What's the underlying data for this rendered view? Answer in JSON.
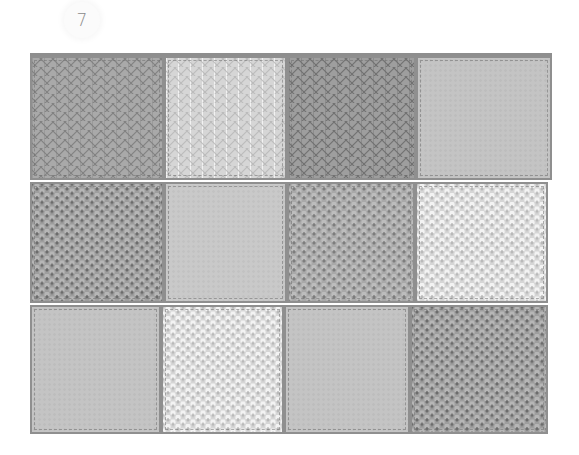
{
  "page": {
    "number": "7"
  },
  "blanket": {
    "rows": 3,
    "columns": 4,
    "squares": [
      {
        "row": 1,
        "col": 1,
        "stitch": "stockinette",
        "tone": "mid",
        "color": "#a9a9a9"
      },
      {
        "row": 1,
        "col": 2,
        "stitch": "stockinette",
        "tone": "light",
        "color": "#d6d6d6"
      },
      {
        "row": 1,
        "col": 3,
        "stitch": "stockinette",
        "tone": "dark",
        "color": "#9e9e9e"
      },
      {
        "row": 1,
        "col": 4,
        "stitch": "smooth",
        "tone": "flat",
        "color": "#c4c4c4"
      },
      {
        "row": 2,
        "col": 1,
        "stitch": "purl",
        "tone": "dark",
        "color": "#9e9e9e"
      },
      {
        "row": 2,
        "col": 2,
        "stitch": "smooth",
        "tone": "flat",
        "color": "#c9c9c9"
      },
      {
        "row": 2,
        "col": 3,
        "stitch": "purl",
        "tone": "mid",
        "color": "#a9a9a9"
      },
      {
        "row": 2,
        "col": 4,
        "stitch": "purl",
        "tone": "light",
        "color": "#d6d6d6"
      },
      {
        "row": 3,
        "col": 1,
        "stitch": "smooth",
        "tone": "flat",
        "color": "#c4c4c4"
      },
      {
        "row": 3,
        "col": 2,
        "stitch": "purl",
        "tone": "light",
        "color": "#d6d6d6"
      },
      {
        "row": 3,
        "col": 3,
        "stitch": "smooth",
        "tone": "flat",
        "color": "#c4c4c4"
      },
      {
        "row": 3,
        "col": 4,
        "stitch": "purl",
        "tone": "dark",
        "color": "#9e9e9e"
      }
    ],
    "seam_color": "#8f8f8f"
  }
}
